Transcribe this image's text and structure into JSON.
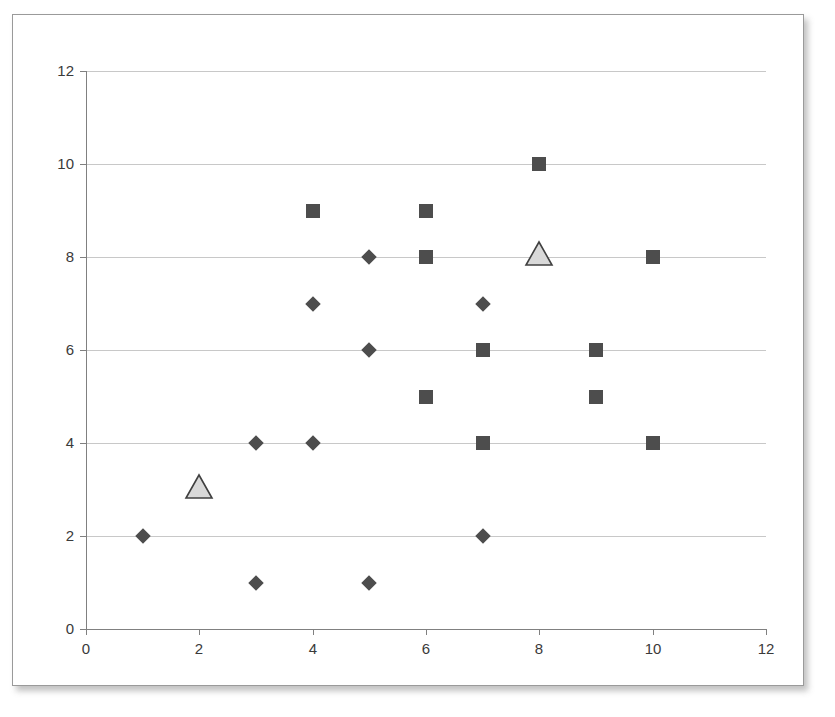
{
  "chart_data": {
    "type": "scatter",
    "title": "",
    "subtitle": "",
    "xlabel": "",
    "ylabel": "",
    "xlim": [
      0,
      12
    ],
    "ylim": [
      0,
      12
    ],
    "x_ticks": [
      0,
      2,
      4,
      6,
      8,
      10,
      12
    ],
    "y_ticks": [
      0,
      2,
      4,
      6,
      8,
      10,
      12
    ],
    "grid": "horizontal",
    "legend": "none",
    "colors": {
      "diamond_fill": "#4d4d4d",
      "square_fill": "#4d4d4d",
      "triangle_fill": "#d9d9d9",
      "triangle_stroke": "#404040",
      "gridline": "#c8c8c8",
      "axis": "#808080",
      "tick_text": "#3a3a3a",
      "frame_border": "#9a9a9a",
      "plot_background": "#ffffff"
    },
    "series": [
      {
        "name": "Series 1",
        "marker": "diamond",
        "color": "#4d4d4d",
        "points": [
          [
            1,
            2
          ],
          [
            3,
            1
          ],
          [
            3,
            4
          ],
          [
            4,
            4
          ],
          [
            4,
            7
          ],
          [
            5,
            1
          ],
          [
            5,
            6
          ],
          [
            5,
            8
          ],
          [
            7,
            2
          ],
          [
            7,
            7
          ]
        ]
      },
      {
        "name": "Series 2",
        "marker": "square",
        "color": "#4d4d4d",
        "points": [
          [
            4,
            9
          ],
          [
            6,
            9
          ],
          [
            6,
            8
          ],
          [
            6,
            5
          ],
          [
            7,
            6
          ],
          [
            7,
            4
          ],
          [
            8,
            10
          ],
          [
            9,
            6
          ],
          [
            9,
            5
          ],
          [
            10,
            8
          ],
          [
            10,
            4
          ]
        ]
      },
      {
        "name": "Series 3",
        "marker": "triangle",
        "color": "#d9d9d9",
        "points": [
          [
            2,
            3
          ],
          [
            8,
            8
          ]
        ]
      }
    ]
  },
  "axes": {
    "x_tick_labels": [
      "0",
      "2",
      "4",
      "6",
      "8",
      "10",
      "12"
    ],
    "y_tick_labels": [
      "0",
      "2",
      "4",
      "6",
      "8",
      "10",
      "12"
    ]
  }
}
